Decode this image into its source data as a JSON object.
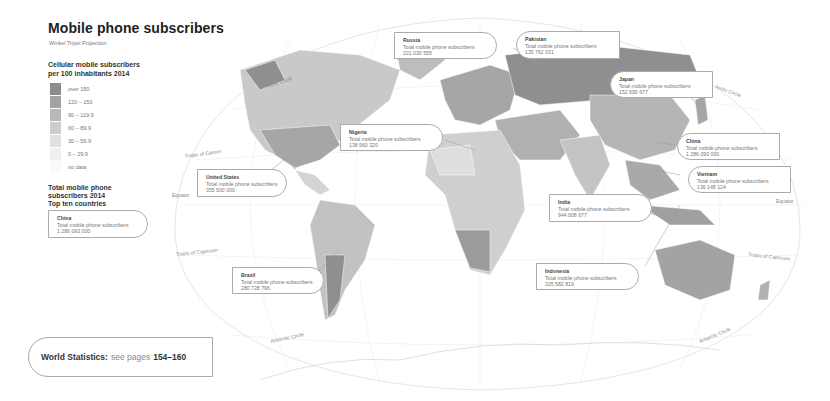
{
  "header": {
    "title": "Mobile phone subscribers",
    "subtitle": "Winkel Tripel Projection"
  },
  "legend": {
    "title_line1": "Cellular mobile subscribers",
    "title_line2": "per 100 inhabitants 2014",
    "items": [
      {
        "label": "over 150",
        "color": "#8c8c8c"
      },
      {
        "label": "120 – 150",
        "color": "#a3a3a3"
      },
      {
        "label": "90 – 119.9",
        "color": "#b8b8b8"
      },
      {
        "label": "60 – 89.9",
        "color": "#cdcdcd"
      },
      {
        "label": "30 – 59.9",
        "color": "#e0e0e0"
      },
      {
        "label": "0 – 29.9",
        "color": "#efefef"
      },
      {
        "label": "no data",
        "color": "#fafafa"
      }
    ]
  },
  "top_ten": {
    "title_line1": "Total mobile phone",
    "title_line2": "subscribers 2014",
    "title_line3": "Top ten countries",
    "example": {
      "name": "China",
      "label": "Total mobile phone subscribers",
      "value": "1 286 093 000"
    }
  },
  "callouts": [
    {
      "name": "Russia",
      "label": "Total mobile phone subscribers",
      "value": "221 030 555"
    },
    {
      "name": "Pakistan",
      "label": "Total mobile phone subscribers",
      "value": "135 762 031"
    },
    {
      "name": "Japan",
      "label": "Total mobile phone subscribers",
      "value": "152 695 677"
    },
    {
      "name": "China",
      "label": "Total mobile phone subscribers",
      "value": "1 286 093 000"
    },
    {
      "name": "Vietnam",
      "label": "Total mobile phone subscribers",
      "value": "136 148 124"
    },
    {
      "name": "Nigeria",
      "label": "Total mobile phone subscribers",
      "value": "138 960 320"
    },
    {
      "name": "United States",
      "label": "Total mobile phone subscribers",
      "value": "355 500 000"
    },
    {
      "name": "India",
      "label": "Total mobile phone subscribers",
      "value": "944 008 677"
    },
    {
      "name": "Indonesia",
      "label": "Total mobile phone subscribers",
      "value": "325 582 819"
    },
    {
      "name": "Brazil",
      "label": "Total mobile phone subscribers",
      "value": "280 728 796"
    }
  ],
  "geo_labels": {
    "arctic_circle": "Arctic Circle",
    "tropic_cancer": "Tropic of Cancer",
    "equator": "Equator",
    "tropic_capricorn": "Tropic of Capricorn",
    "antarctic_circle": "Antarctic Circle"
  },
  "footer": {
    "bold": "World Statistics:",
    "text": "see pages",
    "pages": "154–160"
  }
}
